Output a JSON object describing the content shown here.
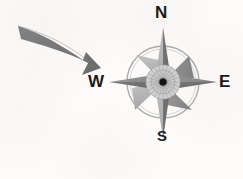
{
  "page": {
    "background_color": "#fcfbfa",
    "ink_color": "#1a1a1a"
  },
  "illustration": {
    "name": "compass-rose-with-arrow",
    "arrow": {
      "icon": "curved-arrow-icon",
      "direction": "down-right",
      "color": "#7b7b7b",
      "description": "curved tapered arrow pointing toward the compass rose"
    },
    "compass": {
      "icon": "compass-rose-icon",
      "center_x": 163,
      "center_y": 82,
      "ring_radius": 36,
      "point_radius": 55,
      "colors": {
        "dark": "#6e6e6e",
        "mid": "#8d8d8d",
        "light": "#b5b5b5",
        "ring": "#a9a9a9",
        "hub_center": "#111111"
      },
      "labels": {
        "north": "N",
        "west": "W",
        "east": "E",
        "south": "S"
      }
    }
  },
  "question": {
    "number": "2.",
    "choices": [
      {
        "label": "west",
        "selected": false
      },
      {
        "label": "wept",
        "selected": false
      }
    ]
  }
}
